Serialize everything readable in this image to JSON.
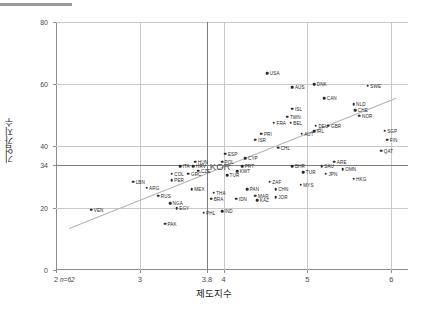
{
  "chart_data": {
    "type": "scatter",
    "title": "",
    "xlabel": "제도지수",
    "ylabel": "기업가지수",
    "xlim": [
      2,
      6.2
    ],
    "ylim": [
      0,
      80
    ],
    "xticks": [
      "2",
      "3",
      "3.8",
      "4",
      "5",
      "6"
    ],
    "xtick_values": [
      2,
      3,
      3.8,
      4,
      5,
      6
    ],
    "yticks": [
      "0",
      "20",
      "34",
      "40",
      "60",
      "80"
    ],
    "ytick_values": [
      0,
      20,
      34,
      40,
      60,
      80
    ],
    "grid": "horizontal-and-reference-lines",
    "legend": "none",
    "note": "n=62",
    "highlight": {
      "label": "KOR",
      "x": 3.8,
      "y": 34
    },
    "trendline": {
      "x1": 2.15,
      "y1": 13.5,
      "x2": 6.05,
      "y2": 55.5
    },
    "points": [
      {
        "label": "USA",
        "x": 4.52,
        "y": 63.5,
        "lpos": "right"
      },
      {
        "label": "AUS",
        "x": 4.82,
        "y": 59.0,
        "lpos": "right"
      },
      {
        "label": "DNK",
        "x": 5.08,
        "y": 60.0,
        "lpos": "right"
      },
      {
        "label": "SWE",
        "x": 5.72,
        "y": 59.5,
        "lpos": "right"
      },
      {
        "label": "CAN",
        "x": 5.2,
        "y": 55.5,
        "lpos": "right"
      },
      {
        "label": "NLD",
        "x": 5.55,
        "y": 53.5,
        "lpos": "right"
      },
      {
        "label": "CHE",
        "x": 5.57,
        "y": 51.5,
        "lpos": "right"
      },
      {
        "label": "NOR",
        "x": 5.62,
        "y": 49.8,
        "lpos": "right"
      },
      {
        "label": "ISL",
        "x": 4.82,
        "y": 52.0,
        "lpos": "right"
      },
      {
        "label": "TWN",
        "x": 4.76,
        "y": 49.5,
        "lpos": "right"
      },
      {
        "label": "FRA",
        "x": 4.6,
        "y": 47.5,
        "lpos": "right"
      },
      {
        "label": "BEL",
        "x": 4.8,
        "y": 47.5,
        "lpos": "right"
      },
      {
        "label": "DEU",
        "x": 5.1,
        "y": 46.5,
        "lpos": "right"
      },
      {
        "label": "GBR",
        "x": 5.25,
        "y": 46.5,
        "lpos": "right"
      },
      {
        "label": "IRL",
        "x": 5.08,
        "y": 44.8,
        "lpos": "right"
      },
      {
        "label": "AUT",
        "x": 4.93,
        "y": 44.0,
        "lpos": "right"
      },
      {
        "label": "SGP",
        "x": 5.92,
        "y": 45.0,
        "lpos": "right"
      },
      {
        "label": "FIN",
        "x": 5.95,
        "y": 42.0,
        "lpos": "right"
      },
      {
        "label": "PRI",
        "x": 4.45,
        "y": 44.0,
        "lpos": "right"
      },
      {
        "label": "ISR",
        "x": 4.38,
        "y": 42.0,
        "lpos": "right"
      },
      {
        "label": "CHL",
        "x": 4.65,
        "y": 39.5,
        "lpos": "right"
      },
      {
        "label": "QAT",
        "x": 5.88,
        "y": 38.5,
        "lpos": "right"
      },
      {
        "label": "ARE",
        "x": 5.32,
        "y": 35.0,
        "lpos": "right"
      },
      {
        "label": "CYP",
        "x": 4.26,
        "y": 36.0,
        "lpos": "right"
      },
      {
        "label": "BHR",
        "x": 4.82,
        "y": 33.5,
        "lpos": "right"
      },
      {
        "label": "SAU",
        "x": 5.17,
        "y": 33.5,
        "lpos": "right"
      },
      {
        "label": "OMN",
        "x": 5.42,
        "y": 32.5,
        "lpos": "right"
      },
      {
        "label": "JPN",
        "x": 5.22,
        "y": 31.0,
        "lpos": "right"
      },
      {
        "label": "HKG",
        "x": 5.55,
        "y": 29.5,
        "lpos": "right"
      },
      {
        "label": "ESP",
        "x": 4.02,
        "y": 37.5,
        "lpos": "right"
      },
      {
        "label": "POL",
        "x": 3.98,
        "y": 35.0,
        "lpos": "right"
      },
      {
        "label": "PRT",
        "x": 4.22,
        "y": 33.5,
        "lpos": "right"
      },
      {
        "label": "KWT",
        "x": 4.16,
        "y": 31.8,
        "lpos": "right"
      },
      {
        "label": "TUR",
        "x": 4.04,
        "y": 30.5,
        "lpos": "right"
      },
      {
        "label": "TUR2",
        "x": 4.95,
        "y": 31.5,
        "lpos": "right"
      },
      {
        "label": "HUN",
        "x": 3.66,
        "y": 35.0,
        "lpos": "right"
      },
      {
        "label": "ITA",
        "x": 3.48,
        "y": 33.5,
        "lpos": "right"
      },
      {
        "label": "HRV",
        "x": 3.64,
        "y": 33.5,
        "lpos": "right"
      },
      {
        "label": "CZE",
        "x": 3.7,
        "y": 32.0,
        "lpos": "right"
      },
      {
        "label": "COL",
        "x": 3.38,
        "y": 31.0,
        "lpos": "right"
      },
      {
        "label": "GRC",
        "x": 3.58,
        "y": 31.0,
        "lpos": "right"
      },
      {
        "label": "PER",
        "x": 3.38,
        "y": 29.0,
        "lpos": "right"
      },
      {
        "label": "LBN",
        "x": 2.92,
        "y": 28.5,
        "lpos": "right"
      },
      {
        "label": "ARG",
        "x": 3.08,
        "y": 26.5,
        "lpos": "right"
      },
      {
        "label": "MEX",
        "x": 3.62,
        "y": 26.0,
        "lpos": "right"
      },
      {
        "label": "THA",
        "x": 3.88,
        "y": 25.0,
        "lpos": "right"
      },
      {
        "label": "PAN",
        "x": 4.28,
        "y": 26.0,
        "lpos": "right"
      },
      {
        "label": "CHN",
        "x": 4.62,
        "y": 26.0,
        "lpos": "right"
      },
      {
        "label": "BRA",
        "x": 3.85,
        "y": 23.0,
        "lpos": "right"
      },
      {
        "label": "IDN",
        "x": 4.15,
        "y": 23.0,
        "lpos": "right"
      },
      {
        "label": "MAR",
        "x": 4.38,
        "y": 24.0,
        "lpos": "right"
      },
      {
        "label": "KAZ",
        "x": 4.4,
        "y": 22.5,
        "lpos": "right"
      },
      {
        "label": "ZAF",
        "x": 4.55,
        "y": 28.5,
        "lpos": "right"
      },
      {
        "label": "MYS",
        "x": 4.92,
        "y": 27.5,
        "lpos": "right"
      },
      {
        "label": "JOR",
        "x": 4.62,
        "y": 23.5,
        "lpos": "right"
      },
      {
        "label": "RUS",
        "x": 3.22,
        "y": 24.0,
        "lpos": "right"
      },
      {
        "label": "NGA",
        "x": 3.36,
        "y": 21.5,
        "lpos": "right"
      },
      {
        "label": "EGY",
        "x": 3.44,
        "y": 20.0,
        "lpos": "right"
      },
      {
        "label": "PHL",
        "x": 3.76,
        "y": 18.5,
        "lpos": "right"
      },
      {
        "label": "IND",
        "x": 3.98,
        "y": 19.0,
        "lpos": "right"
      },
      {
        "label": "VEN",
        "x": 2.42,
        "y": 19.5,
        "lpos": "right"
      },
      {
        "label": "PAK",
        "x": 3.3,
        "y": 15.0,
        "lpos": "right"
      }
    ]
  }
}
